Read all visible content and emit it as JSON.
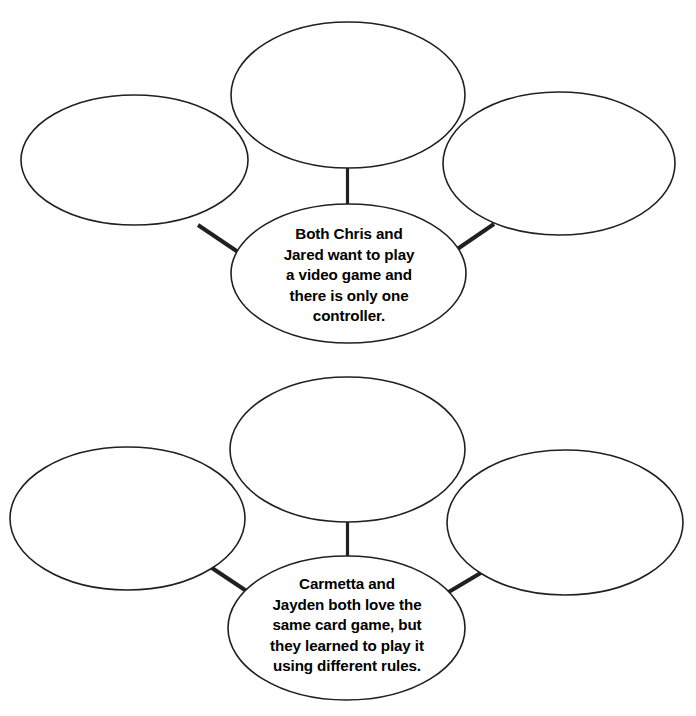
{
  "page": {
    "background_color": "#ffffff",
    "ink_color": "#231f20",
    "width": 696,
    "height": 716
  },
  "header": {
    "clipped_text": ""
  },
  "groups": [
    {
      "id": "scenario-1",
      "center_bubble": {
        "name": "scenario-1-center-bubble",
        "text": "Both Chris and\nJared want to play\na video game and\nthere is only one\ncontroller.",
        "filled": true
      },
      "blank_ellipses": [
        {
          "name": "scenario-1-top-response-ellipse",
          "position": "top",
          "text": ""
        },
        {
          "name": "scenario-1-left-response-ellipse",
          "position": "left",
          "text": ""
        },
        {
          "name": "scenario-1-right-response-ellipse",
          "position": "right",
          "text": ""
        }
      ],
      "connectors": [
        {
          "name": "scenario-1-connector-top",
          "from": "center_bubble",
          "to": "top"
        },
        {
          "name": "scenario-1-connector-left",
          "from": "center_bubble",
          "to": "left"
        },
        {
          "name": "scenario-1-connector-right",
          "from": "center_bubble",
          "to": "right"
        }
      ]
    },
    {
      "id": "scenario-2",
      "center_bubble": {
        "name": "scenario-2-center-bubble",
        "text": "Carmetta and\nJayden both love the\nsame card game, but\nthey learned to play it\nusing different rules.",
        "filled": true
      },
      "blank_ellipses": [
        {
          "name": "scenario-2-top-response-ellipse",
          "position": "top",
          "text": ""
        },
        {
          "name": "scenario-2-left-response-ellipse",
          "position": "left",
          "text": ""
        },
        {
          "name": "scenario-2-right-response-ellipse",
          "position": "right",
          "text": ""
        }
      ],
      "connectors": [
        {
          "name": "scenario-2-connector-top",
          "from": "center_bubble",
          "to": "top"
        },
        {
          "name": "scenario-2-connector-left",
          "from": "center_bubble",
          "to": "left"
        },
        {
          "name": "scenario-2-connector-right",
          "from": "center_bubble",
          "to": "right"
        }
      ]
    }
  ]
}
